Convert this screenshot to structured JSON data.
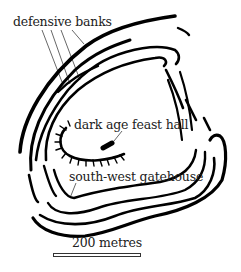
{
  "diagram": {
    "labels": {
      "banks": "defensive banks",
      "hall": "dark age feast hall",
      "gatehouse": "south-west gatehouse"
    },
    "scale": {
      "label": "200 metres"
    },
    "colors": {
      "ink": "#000000",
      "text": "#222222",
      "background": "#ffffff"
    }
  }
}
